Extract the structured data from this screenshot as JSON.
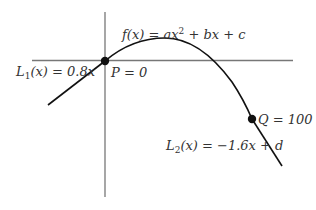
{
  "diagram": {
    "labels": {
      "f": {
        "name": "f(x)",
        "expr_parts": [
          "f(x) = ax",
          "2",
          " + bx + c"
        ]
      },
      "L1": {
        "fn": "L",
        "sub": "1",
        "rest": "(x) = 0.8x"
      },
      "L2": {
        "fn": "L",
        "sub": "2",
        "rest": "(x) = −1.6x + d"
      },
      "P": "P = 0",
      "Q": "Q = 100"
    },
    "points": [
      {
        "id": "P",
        "value": 0
      },
      {
        "id": "Q",
        "value": 100
      }
    ],
    "lines": [
      {
        "id": "L1",
        "slope": 0.8
      },
      {
        "id": "L2",
        "slope": -1.6,
        "intercept": "d"
      }
    ],
    "curve": {
      "id": "f",
      "form": "quadratic",
      "coefficients": [
        "a",
        "b",
        "c"
      ]
    },
    "colors": {
      "axis": "#777777",
      "curve": "#111111",
      "point": "#111111",
      "text": "#333333"
    }
  }
}
